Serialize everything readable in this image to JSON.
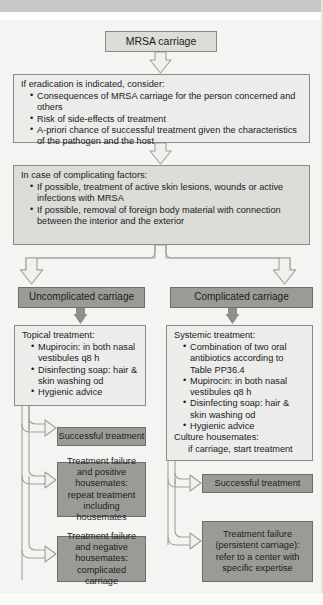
{
  "diagram": {
    "colors": {
      "page_background": "#f4f4f2",
      "top_band": "#c8c8c8",
      "node_light_fill": "#dcdcd8",
      "node_dark_fill": "#9b9b96",
      "node_open_fill": "#ececeb",
      "node_border": "#8b8b86",
      "arrow_solid": "#8f8f8a",
      "arrow_hollow_fill": "#f4f4f2",
      "arrow_hollow_stroke": "#9a9a95",
      "text": "#1b1b1b"
    },
    "nodes": {
      "start": {
        "label": "MRSA carriage"
      },
      "eradication": {
        "heading": "If eradication is indicated, consider:",
        "bullets": [
          "Consequences of MRSA carriage for the person concerned and others",
          "Risk of side-effects of treatment",
          "A-priori chance of successful treatment given the characteristics of the pathogen and the host"
        ]
      },
      "complicating": {
        "heading": "In case of complicating factors:",
        "bullets": [
          "If possible, treatment of active skin lesions, wounds or active infections with MRSA",
          "If possible, removal of foreign body material with connection between the interior and the exterior"
        ]
      },
      "branch_left": {
        "label": "Uncomplicated carriage"
      },
      "branch_right": {
        "label": "Complicated carriage"
      },
      "topical": {
        "heading": "Topical treatment:",
        "bullets": [
          "Mupirocin: in both nasal vestibules q8 h",
          "Disinfecting soap: hair & skin washing od",
          "Hygienic advice"
        ]
      },
      "systemic": {
        "heading": "Systemic treatment:",
        "bullets": [
          "Combination of two oral antibiotics according to Table PP36.4",
          "Mupirocin: in both nasal vestibules q8 h",
          "Disinfecting soap: hair & skin washing od",
          "Hygienic advice"
        ],
        "footer_heading": "Culture housemates:",
        "footer_line": "if carriage, start treatment"
      },
      "left_outcome_1": {
        "label": "Successful treatment"
      },
      "left_outcome_2": {
        "label": "Treatment failure and positive housemates: repeat treatment including housemates"
      },
      "left_outcome_3": {
        "label": "Treatment failure and negative housemates: complicated carriage"
      },
      "right_outcome_1": {
        "label": "Successful treatment"
      },
      "right_outcome_2": {
        "label": "Treatment failure (persistent carriage): refer to a center with specific expertise"
      }
    }
  }
}
